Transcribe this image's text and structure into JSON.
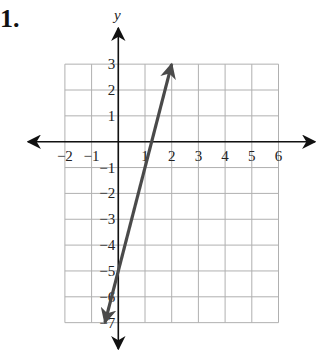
{
  "problem": {
    "number": "1."
  },
  "chart_data": {
    "type": "line",
    "title": "",
    "xlabel": "",
    "ylabel": "y",
    "xlim": [
      -2,
      6
    ],
    "ylim": [
      -7,
      3
    ],
    "grid": true,
    "x_ticks": [
      "-2",
      "-1",
      "1",
      "2",
      "3",
      "4",
      "5",
      "6"
    ],
    "y_ticks": [
      "3",
      "2",
      "1",
      "-1",
      "-2",
      "-3",
      "-4",
      "-5",
      "-6",
      "-7"
    ],
    "series": [
      {
        "name": "line",
        "equation": "y = 4x - 5",
        "points": [
          [
            -0.5,
            -7
          ],
          [
            0,
            -5
          ],
          [
            1.25,
            0
          ],
          [
            2,
            3
          ]
        ],
        "arrows": "both",
        "color": "#4a4a4a"
      }
    ]
  },
  "colors": {
    "grid": "#b0b0b0",
    "axis": "#111111",
    "line": "#4a4a4a"
  }
}
